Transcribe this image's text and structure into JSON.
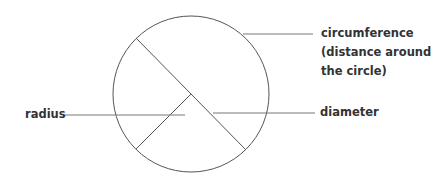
{
  "labels": {
    "circumference_line1": "circumference",
    "circumference_line2": "(distance around",
    "circumference_line3": "the circle)",
    "radius": "radius",
    "diameter": "diameter"
  },
  "colors": {
    "stroke": "#555555",
    "text": "#333333"
  }
}
